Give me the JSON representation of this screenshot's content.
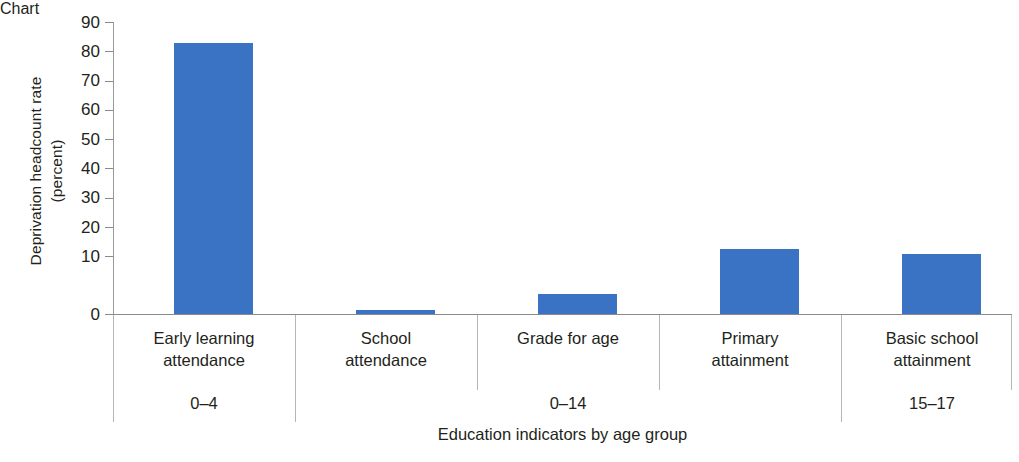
{
  "chart_data": {
    "type": "bar",
    "title": "",
    "xlabel": "Education indicators by age group",
    "ylabel": "Deprivation headcount rate\n(percent)",
    "ylabel_line1": "Deprivation headcount rate",
    "ylabel_line2": "(percent)",
    "categories": [
      "Early learning\nattendance",
      "School\nattendance",
      "Grade for age",
      "Primary\nattainment",
      "Basic school\nattainment"
    ],
    "values": [
      83.5,
      1.3,
      6.2,
      20.1,
      18.6
    ],
    "ylim": [
      0,
      90
    ],
    "yticks": [
      0,
      10,
      20,
      30,
      40,
      50,
      60,
      70,
      80,
      90
    ],
    "ytick_labels": [
      "0",
      "10",
      "20",
      "30",
      "40",
      "50",
      "60",
      "70",
      "80",
      "90"
    ],
    "grid": false,
    "legend": null,
    "bar_color": "#3a72c4",
    "axis_color": "#8a8a8a",
    "text_color": "#231f20",
    "age_groups": [
      {
        "label": "0–4",
        "categories": [
          "Early learning\nattendance"
        ]
      },
      {
        "label": "0–14",
        "categories": [
          "School\nattendance",
          "Grade for age",
          "Primary\nattainment"
        ]
      },
      {
        "label": "15–17",
        "categories": [
          "Basic school\nattainment"
        ]
      }
    ]
  },
  "axes": {
    "y_title_line1": "Deprivation headcount rate",
    "y_title_line2": "(percent)",
    "x_title": "Education indicators by age group",
    "ticks": {
      "t0": "0",
      "t1": "10",
      "t2": "20",
      "t3": "30",
      "t4": "40",
      "t5": "50",
      "t6": "60",
      "t7": "70",
      "t8": "80",
      "t9": "90"
    }
  },
  "categories": {
    "c0": "Early learning\nattendance",
    "c1": "School\nattendance",
    "c2": "Grade for age",
    "c3": "Primary\nattainment",
    "c4": "Basic school\nattainment"
  },
  "groups": {
    "g0": "0–4",
    "g1": "0–14",
    "g2": "15–17"
  }
}
